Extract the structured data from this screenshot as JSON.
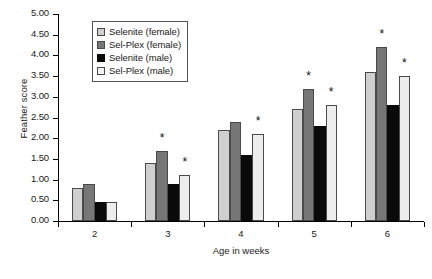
{
  "chart_data": {
    "type": "bar",
    "title": "",
    "xlabel": "Age in weeks",
    "ylabel": "Feather score",
    "categories": [
      "2",
      "3",
      "4",
      "5",
      "6"
    ],
    "ylim": [
      0,
      5
    ],
    "ytick_step": 0.5,
    "ytick_labels": [
      "0.00",
      "0.50",
      "1.00",
      "1.50",
      "2.00",
      "2.50",
      "3.00",
      "3.50",
      "4.00",
      "4.50",
      "5.00"
    ],
    "grid": false,
    "legend_position": "top-left-inside",
    "annotation_symbol": "*",
    "series": [
      {
        "name": "Selenite (female)",
        "color": "#cfcfcf",
        "values": [
          0.8,
          1.4,
          2.2,
          2.7,
          3.6
        ],
        "significant": [
          false,
          false,
          false,
          false,
          false
        ]
      },
      {
        "name": "Sel-Plex (female)",
        "color": "#777777",
        "values": [
          0.9,
          1.7,
          2.4,
          3.2,
          4.2
        ],
        "significant": [
          false,
          true,
          false,
          true,
          true
        ]
      },
      {
        "name": "Selenite (male)",
        "color": "#0a0a0a",
        "values": [
          0.45,
          0.9,
          1.6,
          2.3,
          2.8
        ],
        "significant": [
          false,
          false,
          false,
          false,
          false
        ]
      },
      {
        "name": "Sel-Plex (male)",
        "color": "#ededed",
        "values": [
          0.47,
          1.1,
          2.1,
          2.8,
          3.5
        ],
        "significant": [
          false,
          true,
          true,
          true,
          true
        ]
      }
    ]
  }
}
